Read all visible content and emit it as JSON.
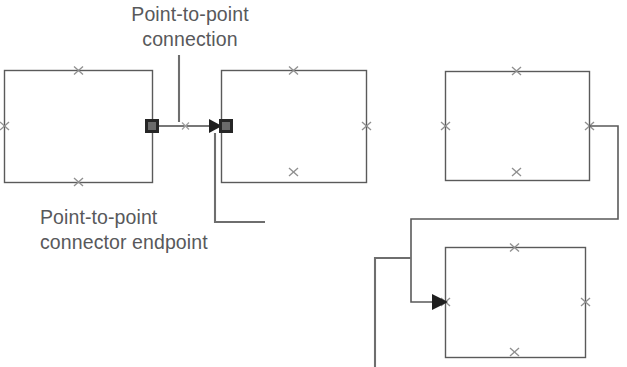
{
  "figure": {
    "kind": "visio-connector-diagram",
    "background_color": "#ffffff",
    "shape_stroke_color": "#5a5a5a",
    "connector_stroke_color": "#5a5a5a",
    "connection_point_color": "#8c8c8c",
    "endpoint_fill_color": "#262626",
    "leader_line_color": "#6e6e6e",
    "text_color": "#58595b"
  },
  "annotations": {
    "connection_label": {
      "line1": "Point-to-point",
      "line2": "connection"
    },
    "endpoint_label": {
      "line1": "Point-to-point",
      "line2": "connector endpoint"
    }
  },
  "shapes": [
    {
      "name": "rectangle-top-left",
      "x": 4,
      "y": 70,
      "width": 148,
      "height": 112,
      "connection_points": [
        "top",
        "bottom",
        "left",
        "right"
      ]
    },
    {
      "name": "rectangle-top-middle",
      "x": 221,
      "y": 70,
      "width": 145,
      "height": 112,
      "connection_points": [
        "top",
        "bottom",
        "left",
        "right"
      ]
    },
    {
      "name": "rectangle-top-right",
      "x": 445,
      "y": 71,
      "width": 144,
      "height": 109,
      "connection_points": [
        "top",
        "bottom",
        "left",
        "right"
      ]
    },
    {
      "name": "rectangle-bottom-right",
      "x": 445,
      "y": 247,
      "width": 140,
      "height": 110,
      "connection_points": [
        "top",
        "bottom",
        "left",
        "right"
      ]
    }
  ],
  "connectors": [
    {
      "name": "point-to-point-connector",
      "type": "straight",
      "from_shape": "rectangle-top-left",
      "from_point": "right",
      "to_shape": "rectangle-top-middle",
      "to_point": "left",
      "start_marker": "filled-square-endpoint",
      "mid_marker": "connection-point-cross",
      "end_marker": "arrowhead-with-filled-square-endpoint"
    },
    {
      "name": "dynamic-connector",
      "type": "orthogonal-routed",
      "from_shape": "rectangle-top-right",
      "from_point": "right",
      "to_shape": "rectangle-bottom-right",
      "to_point": "left",
      "end_marker": "arrowhead"
    }
  ],
  "leader_lines": [
    {
      "name": "leader-to-connection",
      "target": "point-to-point-connector midpoint",
      "type": "vertical"
    },
    {
      "name": "leader-to-endpoint",
      "target": "point-to-point-connector end endpoint",
      "type": "elbow"
    },
    {
      "name": "leader-offscreen-bottom",
      "target": "dynamic-connector",
      "type": "elbow"
    }
  ]
}
